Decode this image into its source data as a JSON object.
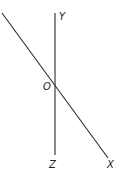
{
  "diagram": {
    "type": "axes-diagram",
    "labels": {
      "y": "Y",
      "origin": "O",
      "z": "Z",
      "x": "X"
    },
    "lines": [
      {
        "name": "vertical-axis",
        "from": [
          55,
          13
        ],
        "to": [
          55,
          155
        ]
      },
      {
        "name": "diagonal-axis",
        "from": [
          2,
          13
        ],
        "to": [
          108,
          158
        ]
      }
    ],
    "colors": {
      "stroke": "#2a2a2a",
      "text": "#222222",
      "background": "#ffffff"
    }
  }
}
